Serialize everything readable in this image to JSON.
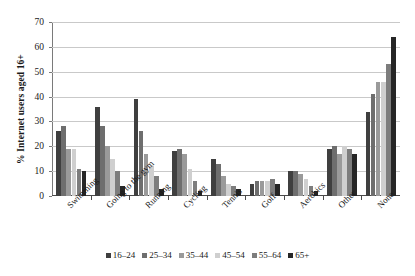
{
  "chart_data": {
    "type": "bar",
    "title": "",
    "xlabel": "",
    "ylabel": "% Internet users aged 16+",
    "ylim": [
      0,
      70
    ],
    "ytick_step": 10,
    "yticks": [
      0,
      10,
      20,
      30,
      40,
      50,
      60,
      70
    ],
    "grid": true,
    "legend_position": "bottom",
    "categories": [
      "Swimming",
      "Going to the gym",
      "Running",
      "Cycling",
      "Tennis",
      "Golf",
      "Aerobics",
      "Other",
      "None"
    ],
    "series": [
      {
        "name": "16–24",
        "color": "#3f3f3f",
        "values": [
          26,
          36,
          39,
          18,
          15,
          5,
          10,
          19,
          34
        ]
      },
      {
        "name": "25–34",
        "color": "#6e6e6e",
        "values": [
          28,
          28,
          26,
          19,
          13,
          6,
          10,
          20,
          41
        ]
      },
      {
        "name": "35–44",
        "color": "#9a9a9a",
        "values": [
          19,
          20,
          17,
          17,
          8,
          6,
          9,
          17,
          46
        ]
      },
      {
        "name": "45–54",
        "color": "#cfcfcf",
        "values": [
          19,
          15,
          12,
          11,
          5,
          6,
          7,
          20,
          46
        ]
      },
      {
        "name": "55–64",
        "color": "#7d7d7d",
        "values": [
          11,
          10,
          8,
          6,
          4,
          7,
          4,
          19,
          53
        ]
      },
      {
        "name": "65+",
        "color": "#262626",
        "values": [
          10,
          4,
          3,
          2,
          3,
          5,
          2,
          17,
          64
        ]
      }
    ]
  }
}
